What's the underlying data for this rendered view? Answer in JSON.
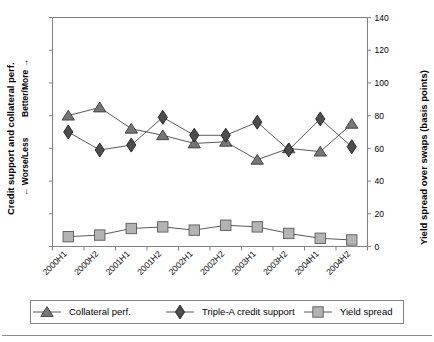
{
  "chart_data": {
    "type": "line",
    "title": "",
    "subtitle": "",
    "categories": [
      "2000H1",
      "2000H2",
      "2001H1",
      "2001H2",
      "2002H1",
      "2002H2",
      "2003H1",
      "2003H2",
      "2004H1",
      "2004H2"
    ],
    "series": [
      {
        "name": "Collateral perf.",
        "marker": "triangle",
        "color": "#767676",
        "values": [
          80,
          85,
          72,
          68,
          63,
          64,
          53,
          60,
          58,
          75
        ]
      },
      {
        "name": "Triple-A credit support",
        "marker": "diamond",
        "color": "#4d4d4d",
        "values": [
          70,
          59,
          62,
          79,
          68,
          68,
          76,
          59,
          78,
          61
        ]
      },
      {
        "name": "Yield spread",
        "marker": "square",
        "color": "#b3b3b3",
        "values": [
          6,
          7,
          11,
          12,
          10,
          13,
          12,
          8,
          5,
          4
        ]
      }
    ],
    "xlabel": "",
    "ylabel_left_title": "Credit support and collateral perf.",
    "ylabel_left_low": "← Worse/Less",
    "ylabel_left_high": "Better/More →",
    "ylabel_right": "Yield spread over swaps (basis points)",
    "ylim": [
      0,
      140
    ],
    "yticks": [
      0,
      20,
      40,
      60,
      80,
      100,
      120,
      140
    ],
    "ytick_labels": [
      "0",
      "20",
      "40",
      "60",
      "80",
      "100",
      "120",
      "140"
    ],
    "grid": false,
    "legend_position": "bottom",
    "right_axis": true,
    "left_axis_unlabeled_ticks": true
  },
  "legend": {
    "entries": [
      {
        "label": "Collateral perf.",
        "icon": "triangle-marker-icon"
      },
      {
        "label": "Triple-A credit support",
        "icon": "diamond-marker-icon"
      },
      {
        "label": "Yield spread",
        "icon": "square-marker-icon"
      }
    ]
  },
  "colors": {
    "collateral": "#767676",
    "credit_support": "#4d4d4d",
    "yield_spread": "#b3b3b3",
    "axis": "#808080",
    "line": "#595959",
    "text": "#000000",
    "background": "#ffffff"
  }
}
